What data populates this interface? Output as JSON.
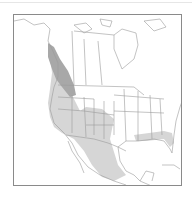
{
  "map": {
    "title": "",
    "region": "North America",
    "type": "species range map",
    "colors": {
      "background": "#ffffff",
      "frame": "#8a8a8a",
      "borders": "#9a9a9a",
      "range_primary": "#d3d3d3",
      "range_dense": "#a9a9a9"
    },
    "range_areas": [
      {
        "name": "Pacific Northwest / British Columbia coast",
        "shade": "dark"
      },
      {
        "name": "Western United States",
        "shade": "light"
      },
      {
        "name": "Mexico (interior and Pacific slope)",
        "shade": "light"
      },
      {
        "name": "Gulf Coast (Louisiana to Florida panhandle)",
        "shade": "light"
      }
    ]
  }
}
